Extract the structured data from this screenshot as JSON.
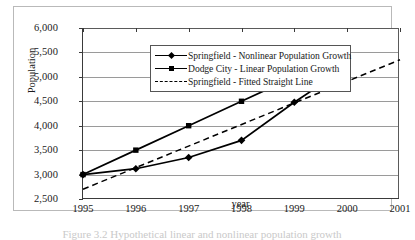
{
  "figure": {
    "caption": "Figure 3.2   Hypothetical linear and nonlinear population growth"
  },
  "chart_data": {
    "type": "line",
    "title": "",
    "xlabel": "year",
    "ylabel": "Population",
    "x": [
      1995,
      1996,
      1997,
      1998,
      1999,
      2000,
      2001
    ],
    "xlim": [
      1995,
      2001
    ],
    "ylim": [
      2500,
      6000
    ],
    "yticks": [
      2500,
      3000,
      3500,
      4000,
      4500,
      5000,
      5500,
      6000
    ],
    "ytick_labels": [
      "2,500",
      "3,000",
      "3,500",
      "4,000",
      "4,500",
      "5,000",
      "5,500",
      "6,000"
    ],
    "xtick_labels": [
      "1995",
      "1996",
      "1997",
      "1998",
      "1999",
      "2000",
      "2001"
    ],
    "grid": "horizontal",
    "legend_position": "top-left-inside",
    "series": [
      {
        "name": "Springfield - Nonlinear Population Growth",
        "marker": "diamond",
        "style": "solid",
        "color": "#000000",
        "x": [
          1995,
          1996,
          1997,
          1998,
          1999,
          2000
        ],
        "values": [
          3000,
          3120,
          3350,
          3700,
          4480,
          5200
        ]
      },
      {
        "name": "Dodge City - Linear Population Growth",
        "marker": "square",
        "style": "solid",
        "color": "#000000",
        "x": [
          1995,
          1996,
          1997,
          1998,
          1999,
          2000
        ],
        "values": [
          3000,
          3500,
          4000,
          4500,
          5000,
          5500
        ]
      },
      {
        "name": "Springfield - Fitted Straight Line",
        "marker": "none",
        "style": "dashed",
        "color": "#000000",
        "x": [
          1995,
          2001
        ],
        "values": [
          2700,
          5350
        ]
      }
    ]
  }
}
